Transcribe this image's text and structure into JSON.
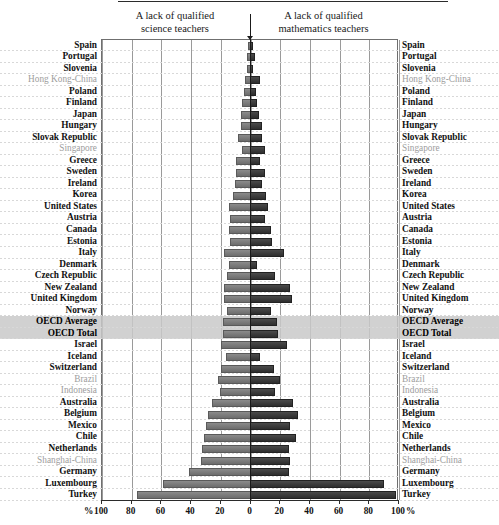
{
  "header": {
    "left_title": "A lack of qualified\nscience teachers",
    "right_title": "A lack of qualified\nmathematics teachers",
    "left_title_line1": "A lack of qualified",
    "left_title_line2": "science teachers",
    "right_title_line1": "A lack of qualified",
    "right_title_line2": "mathematics teachers"
  },
  "axis": {
    "left_unit": "%",
    "right_unit": "%",
    "ticks_left": [
      "100",
      "80",
      "60",
      "40",
      "20",
      "0"
    ],
    "ticks_right": [
      "0",
      "20",
      "40",
      "60",
      "80",
      "100"
    ],
    "max": 100,
    "tick_step": 20
  },
  "colors": {
    "science_bar": "#7a7a7a",
    "mathematics_bar": "#3a3a3a",
    "highlight_band": "#c9c9c9",
    "grid": "#9a9a9a",
    "partner_label": "#9d9d9d"
  },
  "chart_data": {
    "type": "bar",
    "orientation": "horizontal-diverging",
    "title": "",
    "xlabel": "%",
    "ylabel": "",
    "xlim": [
      -100,
      100
    ],
    "grid": true,
    "legend_position": "top",
    "series": [
      {
        "name": "A lack of qualified science teachers",
        "side": "left",
        "color": "#7a7a7a"
      },
      {
        "name": "A lack of qualified mathematics teachers",
        "side": "right",
        "color": "#3a3a3a"
      }
    ],
    "categories": [
      "Spain",
      "Portugal",
      "Slovenia",
      "Hong Kong-China",
      "Poland",
      "Finland",
      "Japan",
      "Hungary",
      "Slovak Republic",
      "Singapore",
      "Greece",
      "Sweden",
      "Ireland",
      "Korea",
      "United States",
      "Austria",
      "Canada",
      "Estonia",
      "Italy",
      "Denmark",
      "Czech Republic",
      "New Zealand",
      "United Kingdom",
      "Norway",
      "OECD Average",
      "OECD Total",
      "Israel",
      "Iceland",
      "Switzerland",
      "Brazil",
      "Indonesia",
      "Australia",
      "Belgium",
      "Mexico",
      "Chile",
      "Netherlands",
      "Shanghai-China",
      "Germany",
      "Luxembourg",
      "Turkey"
    ],
    "rows": [
      {
        "country": "Spain",
        "science": 1,
        "mathematics": 1,
        "kind": "oecd"
      },
      {
        "country": "Portugal",
        "science": 2,
        "mathematics": 2,
        "kind": "oecd"
      },
      {
        "country": "Slovenia",
        "science": 2,
        "mathematics": 1,
        "kind": "oecd"
      },
      {
        "country": "Hong Kong-China",
        "science": 3,
        "mathematics": 6,
        "kind": "partner"
      },
      {
        "country": "Poland",
        "science": 4,
        "mathematics": 3,
        "kind": "oecd"
      },
      {
        "country": "Finland",
        "science": 5,
        "mathematics": 4,
        "kind": "oecd"
      },
      {
        "country": "Japan",
        "science": 6,
        "mathematics": 5,
        "kind": "oecd"
      },
      {
        "country": "Hungary",
        "science": 6,
        "mathematics": 7,
        "kind": "oecd"
      },
      {
        "country": "Slovak Republic",
        "science": 8,
        "mathematics": 7,
        "kind": "oecd"
      },
      {
        "country": "Singapore",
        "science": 5,
        "mathematics": 9,
        "kind": "partner"
      },
      {
        "country": "Greece",
        "science": 9,
        "mathematics": 6,
        "kind": "oecd"
      },
      {
        "country": "Sweden",
        "science": 9,
        "mathematics": 9,
        "kind": "oecd"
      },
      {
        "country": "Ireland",
        "science": 10,
        "mathematics": 7,
        "kind": "oecd"
      },
      {
        "country": "Korea",
        "science": 11,
        "mathematics": 10,
        "kind": "oecd"
      },
      {
        "country": "United States",
        "science": 14,
        "mathematics": 11,
        "kind": "oecd"
      },
      {
        "country": "Austria",
        "science": 13,
        "mathematics": 9,
        "kind": "oecd"
      },
      {
        "country": "Canada",
        "science": 14,
        "mathematics": 13,
        "kind": "oecd"
      },
      {
        "country": "Estonia",
        "science": 13,
        "mathematics": 14,
        "kind": "oecd"
      },
      {
        "country": "Italy",
        "science": 17,
        "mathematics": 22,
        "kind": "oecd"
      },
      {
        "country": "Denmark",
        "science": 14,
        "mathematics": 4,
        "kind": "oecd"
      },
      {
        "country": "Czech Republic",
        "science": 15,
        "mathematics": 16,
        "kind": "oecd"
      },
      {
        "country": "New Zealand",
        "science": 17,
        "mathematics": 26,
        "kind": "oecd"
      },
      {
        "country": "United Kingdom",
        "science": 17,
        "mathematics": 27,
        "kind": "oecd"
      },
      {
        "country": "Norway",
        "science": 15,
        "mathematics": 13,
        "kind": "oecd"
      },
      {
        "country": "OECD Average",
        "science": 18,
        "mathematics": 17,
        "kind": "oecd-total"
      },
      {
        "country": "OECD Total",
        "science": 18,
        "mathematics": 18,
        "kind": "oecd-total"
      },
      {
        "country": "Israel",
        "science": 19,
        "mathematics": 24,
        "kind": "oecd"
      },
      {
        "country": "Iceland",
        "science": 16,
        "mathematics": 6,
        "kind": "oecd"
      },
      {
        "country": "Switzerland",
        "science": 19,
        "mathematics": 15,
        "kind": "oecd"
      },
      {
        "country": "Brazil",
        "science": 21,
        "mathematics": 19,
        "kind": "partner"
      },
      {
        "country": "Indonesia",
        "science": 20,
        "mathematics": 16,
        "kind": "partner"
      },
      {
        "country": "Australia",
        "science": 25,
        "mathematics": 28,
        "kind": "oecd"
      },
      {
        "country": "Belgium",
        "science": 28,
        "mathematics": 31,
        "kind": "oecd"
      },
      {
        "country": "Mexico",
        "science": 29,
        "mathematics": 26,
        "kind": "oecd"
      },
      {
        "country": "Chile",
        "science": 31,
        "mathematics": 30,
        "kind": "oecd"
      },
      {
        "country": "Netherlands",
        "science": 32,
        "mathematics": 25,
        "kind": "oecd"
      },
      {
        "country": "Shanghai-China",
        "science": 33,
        "mathematics": 26,
        "kind": "partner"
      },
      {
        "country": "Germany",
        "science": 41,
        "mathematics": 25,
        "kind": "oecd"
      },
      {
        "country": "Luxembourg",
        "science": 58,
        "mathematics": 89,
        "kind": "oecd"
      },
      {
        "country": "Turkey",
        "science": 76,
        "mathematics": 97,
        "kind": "oecd"
      }
    ]
  }
}
